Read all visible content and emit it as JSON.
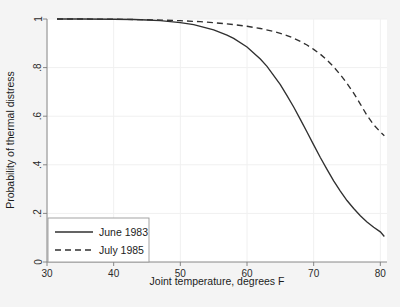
{
  "chart_data": {
    "type": "line",
    "title": "",
    "xlabel": "Joint temperature, degrees F",
    "ylabel": "Probability of thermal distress",
    "xlim": [
      30,
      81
    ],
    "ylim": [
      0,
      1
    ],
    "xticks": [
      "30",
      "40",
      "50",
      "60",
      "70",
      "80"
    ],
    "xtick_values": [
      30,
      40,
      50,
      60,
      70,
      80
    ],
    "yticks": [
      "0",
      ".2",
      ".4",
      ".6",
      ".8",
      "1"
    ],
    "ytick_values": [
      0,
      0.2,
      0.4,
      0.6,
      0.8,
      1
    ],
    "grid": true,
    "legend_position": "lower left",
    "series": [
      {
        "name": "June 1983",
        "style": "solid",
        "color": "#303030",
        "x": [
          31.5,
          35,
          40,
          43,
          45,
          47,
          50,
          52,
          55,
          57,
          58,
          60,
          62,
          63,
          65,
          66,
          67,
          68,
          69,
          70,
          71,
          72,
          73,
          74,
          75,
          76,
          77,
          78,
          79,
          80,
          80.6
        ],
        "y": [
          1.0,
          1.0,
          0.999,
          0.998,
          0.996,
          0.993,
          0.985,
          0.977,
          0.955,
          0.934,
          0.92,
          0.885,
          0.835,
          0.805,
          0.73,
          0.685,
          0.638,
          0.587,
          0.535,
          0.482,
          0.43,
          0.381,
          0.334,
          0.292,
          0.253,
          0.22,
          0.19,
          0.165,
          0.143,
          0.124,
          0.105
        ]
      },
      {
        "name": "July 1985",
        "style": "dashed",
        "color": "#303030",
        "x": [
          31.5,
          35,
          40,
          43,
          45,
          48,
          50,
          53,
          55,
          58,
          60,
          62,
          64,
          65,
          66,
          67,
          68,
          69,
          70,
          71,
          72,
          73,
          74,
          75,
          76,
          77,
          78,
          79,
          80,
          80.6
        ],
        "y": [
          1.0,
          1.0,
          0.999,
          0.998,
          0.997,
          0.995,
          0.993,
          0.989,
          0.985,
          0.977,
          0.97,
          0.961,
          0.949,
          0.941,
          0.932,
          0.921,
          0.908,
          0.893,
          0.875,
          0.855,
          0.831,
          0.803,
          0.771,
          0.735,
          0.695,
          0.65,
          0.603,
          0.565,
          0.535,
          0.52
        ]
      }
    ]
  },
  "legend": {
    "entries": [
      {
        "label": "June 1983",
        "style": "solid"
      },
      {
        "label": "July 1985",
        "style": "dashed"
      }
    ]
  }
}
